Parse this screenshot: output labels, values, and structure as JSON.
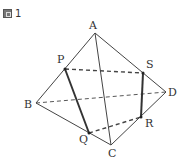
{
  "figure": {
    "label": "図 1",
    "label_icon": "figure-box-icon",
    "label_number": "1"
  },
  "vertices": {
    "A": {
      "label": "A",
      "x": 95,
      "y": 33
    },
    "B": {
      "label": "B",
      "x": 36,
      "y": 103
    },
    "C": {
      "label": "C",
      "x": 111,
      "y": 145
    },
    "D": {
      "label": "D",
      "x": 166,
      "y": 92
    },
    "P": {
      "label": "P",
      "x": 65,
      "y": 69
    },
    "Q": {
      "label": "Q",
      "x": 89,
      "y": 133
    },
    "R": {
      "label": "R",
      "x": 141,
      "y": 117
    },
    "S": {
      "label": "S",
      "x": 143,
      "y": 73
    }
  },
  "edges": {
    "solid": [
      "AB",
      "AC",
      "AD",
      "BC",
      "CD"
    ],
    "dashed": [
      "BD",
      "PS",
      "QR"
    ],
    "bold": [
      "PQ",
      "SR"
    ]
  },
  "colors": {
    "line": "#444444",
    "text": "#333333"
  }
}
